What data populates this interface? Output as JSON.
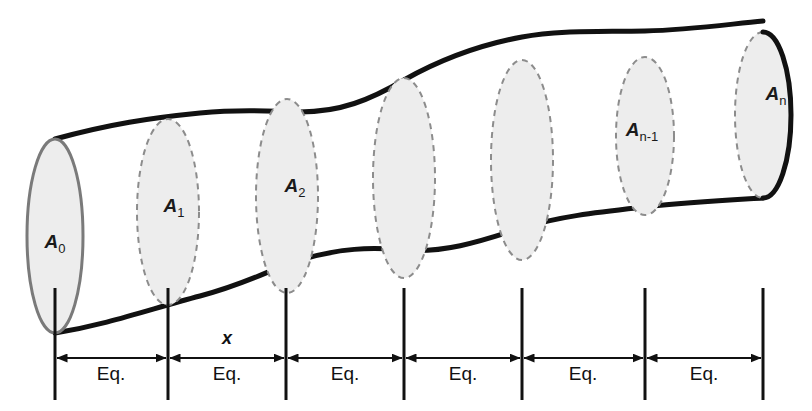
{
  "figure": {
    "type": "duct-cross-section-diagram",
    "colors": {
      "outline": "#111111",
      "endcap_stroke": "#7a7a7a",
      "section_stroke": "#8c8c8c",
      "section_fill": "#ededed",
      "dimension_line": "#111111",
      "background": "#ffffff"
    },
    "sections": [
      {
        "id": "A0",
        "label_base": "A",
        "label_sub": "0",
        "cx": 55,
        "cy": 236,
        "rx": 28,
        "ry": 97,
        "style": "solid",
        "labeled": true,
        "label_x": 55,
        "label_y": 248
      },
      {
        "id": "A1",
        "label_base": "A",
        "label_sub": "1",
        "cx": 168,
        "cy": 212,
        "rx": 31,
        "ry": 93,
        "style": "dashed",
        "labeled": true,
        "label_x": 174,
        "label_y": 212
      },
      {
        "id": "A2",
        "label_base": "A",
        "label_sub": "2",
        "cx": 287,
        "cy": 196,
        "rx": 31,
        "ry": 97,
        "style": "dashed",
        "labeled": true,
        "label_x": 295,
        "label_y": 192
      },
      {
        "id": "A3",
        "label_base": "",
        "label_sub": "",
        "cx": 404,
        "cy": 178,
        "rx": 31,
        "ry": 100,
        "style": "dashed",
        "labeled": false,
        "label_x": 0,
        "label_y": 0
      },
      {
        "id": "A4",
        "label_base": "",
        "label_sub": "",
        "cx": 522,
        "cy": 160,
        "rx": 31,
        "ry": 100,
        "style": "dashed",
        "labeled": false,
        "label_x": 0,
        "label_y": 0
      },
      {
        "id": "An-1",
        "label_base": "A",
        "label_sub": "n-1",
        "cx": 645,
        "cy": 136,
        "rx": 29,
        "ry": 79,
        "style": "dashed",
        "labeled": true,
        "label_x": 642,
        "label_y": 136
      },
      {
        "id": "An",
        "label_base": "A",
        "label_sub": "n",
        "cx": 763,
        "cy": 115,
        "rx": 28,
        "ry": 83,
        "style": "endcap",
        "labeled": true,
        "label_x": 776,
        "label_y": 100
      }
    ],
    "dimension": {
      "axis_y": 358,
      "tick_top": 288,
      "tick_bottom": 400,
      "ticks": [
        55,
        168,
        286,
        404,
        522,
        645,
        763
      ],
      "segments": [
        {
          "label": "Eq.",
          "x1": 55,
          "x2": 168,
          "text_x": 111,
          "text_y": 380
        },
        {
          "label": "Eq.",
          "x1": 168,
          "x2": 286,
          "text_x": 227,
          "text_y": 380
        },
        {
          "label": "Eq.",
          "x1": 286,
          "x2": 404,
          "text_x": 345,
          "text_y": 380
        },
        {
          "label": "Eq.",
          "x1": 404,
          "x2": 522,
          "text_x": 463,
          "text_y": 380
        },
        {
          "label": "Eq.",
          "x1": 522,
          "x2": 645,
          "text_x": 583,
          "text_y": 380
        },
        {
          "label": "Eq.",
          "x1": 645,
          "x2": 763,
          "text_x": 704,
          "text_y": 380
        }
      ],
      "x_label": {
        "text": "x",
        "x": 227,
        "y": 344
      }
    }
  }
}
